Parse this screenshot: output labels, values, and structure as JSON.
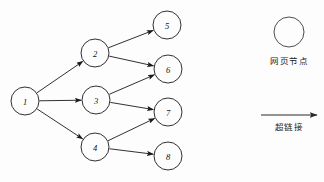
{
  "diagram": {
    "background_color": "#fdfdfd",
    "stroke_color": "#1a1a1a",
    "nodes": [
      {
        "id": "1",
        "label": "1",
        "cx": 25,
        "cy": 101,
        "r": 14
      },
      {
        "id": "2",
        "label": "2",
        "cx": 95,
        "cy": 53,
        "r": 14
      },
      {
        "id": "3",
        "label": "3",
        "cx": 96,
        "cy": 100,
        "r": 14
      },
      {
        "id": "4",
        "label": "4",
        "cx": 95,
        "cy": 147,
        "r": 14
      },
      {
        "id": "5",
        "label": "5",
        "cx": 167,
        "cy": 25,
        "r": 14
      },
      {
        "id": "6",
        "label": "6",
        "cx": 168,
        "cy": 69,
        "r": 14
      },
      {
        "id": "7",
        "label": "7",
        "cx": 168,
        "cy": 112,
        "r": 14
      },
      {
        "id": "8",
        "label": "8",
        "cx": 168,
        "cy": 156,
        "r": 14
      }
    ],
    "edges": [
      {
        "from": "1",
        "to": "2"
      },
      {
        "from": "1",
        "to": "3"
      },
      {
        "from": "1",
        "to": "4"
      },
      {
        "from": "2",
        "to": "5"
      },
      {
        "from": "2",
        "to": "6"
      },
      {
        "from": "3",
        "to": "6"
      },
      {
        "from": "3",
        "to": "7"
      },
      {
        "from": "4",
        "to": "7"
      },
      {
        "from": "4",
        "to": "8"
      }
    ]
  },
  "legend": {
    "node_symbol": {
      "label": "网页节点",
      "cx": 289,
      "cy": 32,
      "r": 15,
      "label_x": 289,
      "label_y": 61
    },
    "edge_symbol": {
      "label": "超链接",
      "x1": 261,
      "x2": 317,
      "y": 115,
      "label_x": 289,
      "label_y": 127
    }
  }
}
